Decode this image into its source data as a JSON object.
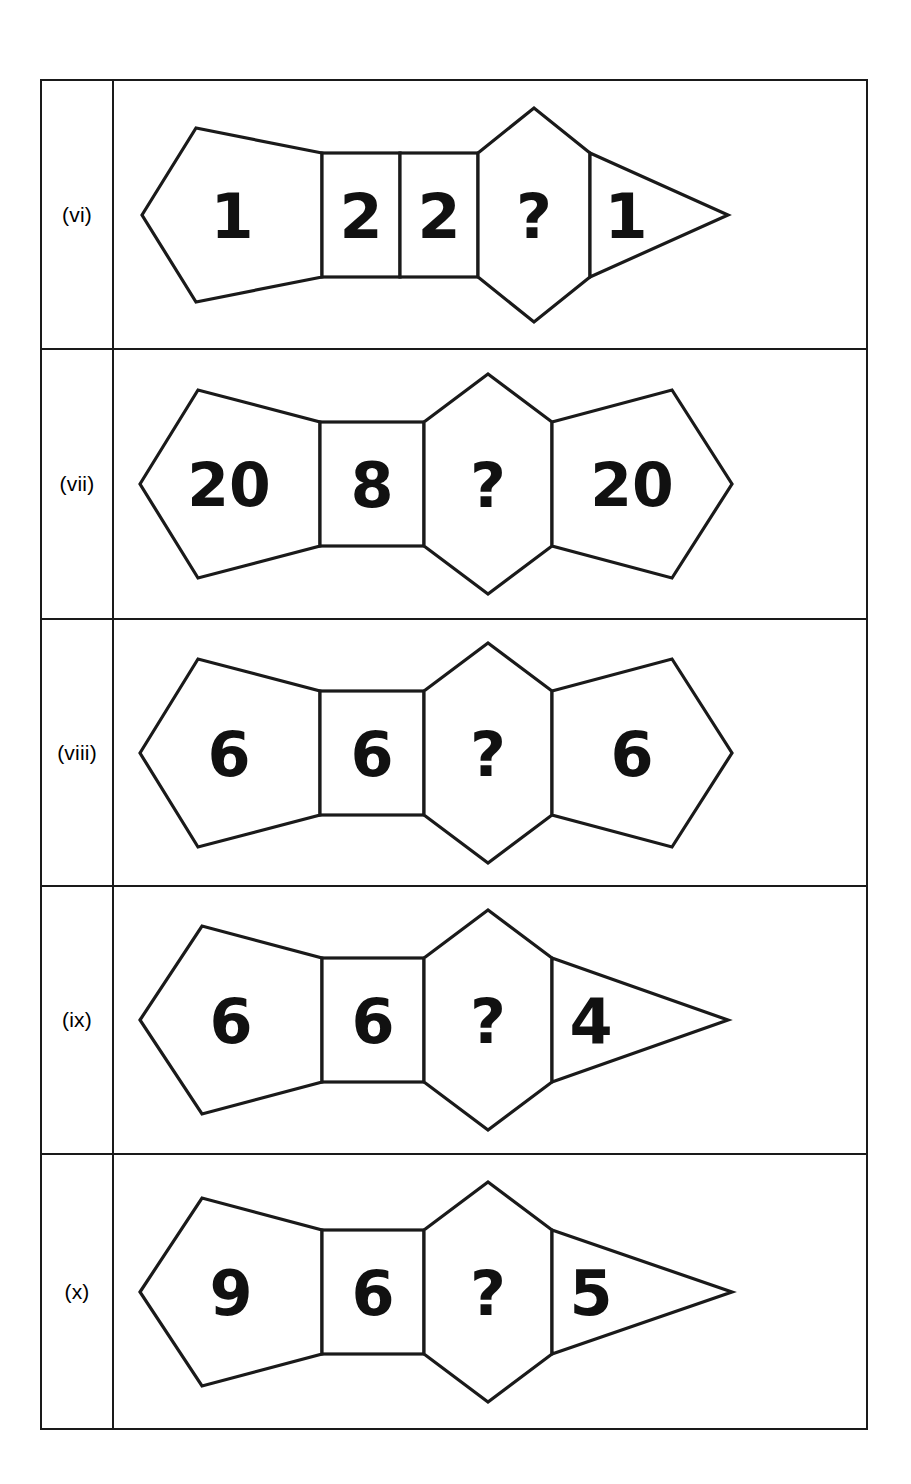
{
  "figure": {
    "type": "puzzle-table",
    "stroke_color": "#1a1a1a",
    "background_color": "#ffffff",
    "text_color": "#111111"
  },
  "rows": [
    {
      "label": "(vi)",
      "cells": [
        {
          "shape": "pentagon-left",
          "value": "1"
        },
        {
          "shape": "square",
          "value": "2"
        },
        {
          "shape": "square",
          "value": "2"
        },
        {
          "shape": "hexagon",
          "value": "?"
        },
        {
          "shape": "triangle-right",
          "value": "1"
        }
      ]
    },
    {
      "label": "(vii)",
      "cells": [
        {
          "shape": "pentagon-left",
          "value": "20"
        },
        {
          "shape": "square",
          "value": "8"
        },
        {
          "shape": "hexagon",
          "value": "?"
        },
        {
          "shape": "pentagon-right",
          "value": "20"
        }
      ]
    },
    {
      "label": "(viii)",
      "cells": [
        {
          "shape": "pentagon-left",
          "value": "6"
        },
        {
          "shape": "square",
          "value": "6"
        },
        {
          "shape": "hexagon",
          "value": "?"
        },
        {
          "shape": "pentagon-right",
          "value": "6"
        }
      ]
    },
    {
      "label": "(ix)",
      "cells": [
        {
          "shape": "pentagon-left",
          "value": "6"
        },
        {
          "shape": "square",
          "value": "6"
        },
        {
          "shape": "hexagon",
          "value": "?"
        },
        {
          "shape": "triangle-right",
          "value": "4"
        }
      ]
    },
    {
      "label": "(x)",
      "cells": [
        {
          "shape": "pentagon-left",
          "value": "9"
        },
        {
          "shape": "square",
          "value": "6"
        },
        {
          "shape": "hexagon",
          "value": "?"
        },
        {
          "shape": "triangle-right",
          "value": "5"
        }
      ]
    }
  ]
}
